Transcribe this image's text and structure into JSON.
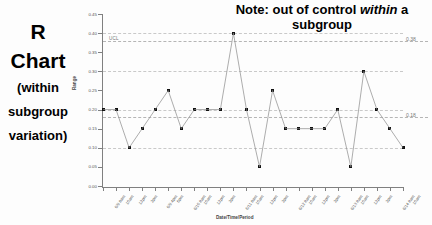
{
  "caption": {
    "line1": "R",
    "line2": "Chart",
    "sub_line1": "(within",
    "sub_line2": "subgroup",
    "sub_line3": "variation)"
  },
  "note": {
    "text_before": "Note: out of control ",
    "emphasis": "within",
    "text_after": " a subgroup"
  },
  "chart_data": {
    "type": "line",
    "title": "",
    "xlabel": "Date/Time/Period",
    "ylabel": "Range",
    "ylim": [
      0.0,
      0.45
    ],
    "ytick_labels": [
      "0.45",
      "0.40",
      "0.35",
      "0.30",
      "0.25",
      "0.20",
      "0.15",
      "0.10",
      "0.05",
      "0.00"
    ],
    "ytick_values": [
      0.45,
      0.4,
      0.35,
      0.3,
      0.25,
      0.2,
      0.15,
      0.1,
      0.05,
      0.0
    ],
    "grid": true,
    "legend": "none",
    "categories": [
      "6/9 8am",
      "10am",
      "12pm",
      "2pm",
      "6/9 4pm",
      "6pm",
      "6/10 8am",
      "10am",
      "12pm",
      "2pm",
      "6/11 8am",
      "10am",
      "12pm",
      "2pm",
      "6/12 8am",
      "10am",
      "12pm",
      "2pm",
      "6/13 8am",
      "10am",
      "12pm",
      "2pm",
      "6/14 8am",
      "10am"
    ],
    "series": [
      {
        "name": "Range",
        "values": [
          0.2,
          0.2,
          0.1,
          0.15,
          0.2,
          0.25,
          0.15,
          0.2,
          0.2,
          0.2,
          0.4,
          0.2,
          0.05,
          0.25,
          0.15,
          0.15,
          0.15,
          0.15,
          0.2,
          0.05,
          0.3,
          0.2,
          0.15,
          0.1
        ]
      }
    ],
    "control_limits": [
      {
        "name": "UCL",
        "label": "UCL",
        "value": 0.38,
        "side_label": "0.38",
        "style": "dashed"
      },
      {
        "name": "CL",
        "label": "",
        "value": 0.18,
        "side_label": "0.18",
        "style": "dashed"
      }
    ],
    "annotations": [
      {
        "text": "out of control within a subgroup",
        "point_index": 10,
        "value": 0.4
      }
    ],
    "colors": {
      "line": "#8a8a8a",
      "marker": "#111111",
      "grid": "#c9c9c9",
      "axis": "#808080",
      "text": "#555555"
    }
  }
}
